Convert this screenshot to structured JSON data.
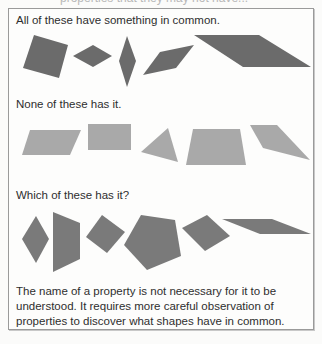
{
  "header": {
    "cutoff_text": "properties that they may not have..."
  },
  "sections": {
    "examples": {
      "label": "All of these have something in common.",
      "color": "#6b6b6b",
      "shapes": [
        {
          "name": "square",
          "points": "34,35 68,45 59,78 23,68"
        },
        {
          "name": "rhombus-wide",
          "points": "73,56 93,45 112,56 93,67"
        },
        {
          "name": "rhombus-tall",
          "points": "127,36 136,61 127,87 119,61"
        },
        {
          "name": "parallelogram-slanted",
          "points": "143,75 160,52 194,45 176,68"
        },
        {
          "name": "parallelogram-large",
          "points": "194,35 259,35 311,67 243,67"
        }
      ]
    },
    "non_examples": {
      "label": "None of these has it.",
      "color": "#a9a9a9",
      "shapes": [
        {
          "name": "parallelogram",
          "points": "30,130 81,130 70,155 22,155"
        },
        {
          "name": "rectangle",
          "points": "88,124 131,124 131,150 88,150"
        },
        {
          "name": "triangle",
          "points": "168,128 178,162 141,152"
        },
        {
          "name": "trapezoid",
          "points": "193,129 240,129 246,165 186,165"
        },
        {
          "name": "quadrilateral",
          "points": "250,125 277,125 310,160 263,148"
        }
      ]
    },
    "question": {
      "label": "Which of these has it?",
      "color": "#7a7a7a",
      "shapes": [
        {
          "name": "rhombus",
          "points": "36,216 49,239 36,263 22,239"
        },
        {
          "name": "trapezoid",
          "points": "53,212 80,223 80,259 53,272"
        },
        {
          "name": "square",
          "points": "102,215 125,232 107,253 86,237"
        },
        {
          "name": "pentagon",
          "points": "141,215 175,220 181,256 147,270 124,245"
        },
        {
          "name": "square-rotated",
          "points": "182,228 207,215 230,236 205,251"
        },
        {
          "name": "parallelogram",
          "points": "222,219 272,219 311,234 260,234"
        }
      ]
    }
  },
  "footer": {
    "text": "The name of a property is not necessary for it to be understood. It requires more careful observation of properties to discover what shapes have in common."
  }
}
